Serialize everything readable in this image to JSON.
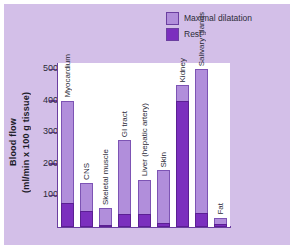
{
  "figure": {
    "background_color": "#d3bfe8",
    "plot_background_color": "#ffffff",
    "axis_color": "#6b3fa0"
  },
  "legend": {
    "position": "top-right",
    "items": [
      {
        "label": "Maximal dilatation",
        "color": "#b18edb"
      },
      {
        "label": "Rest",
        "color": "#7b2fbe"
      }
    ]
  },
  "axis_title": {
    "line1": "Blood flow",
    "line2": "(ml/min x 100 g tissue)"
  },
  "chart_data": {
    "type": "bar",
    "title": "",
    "subtitle": "",
    "xlabel": "",
    "ylabel": "Blood flow (ml/min x 100 g tissue)",
    "ylim": [
      0,
      520
    ],
    "yticks": [
      100,
      200,
      300,
      400,
      500
    ],
    "ytick_labels": [
      "100",
      "200",
      "300",
      "400",
      "500"
    ],
    "grid": false,
    "legend_position": "top-right",
    "overlap": "rest bars drawn in front of maximal dilatation bars, sharing the same baseline",
    "categories": [
      "Myocardium",
      "CNS",
      "Skeletal muscle",
      "GI tract",
      "Liver (hepatic artery)",
      "Skin",
      "Kidney",
      "Salivary glands",
      "Fat"
    ],
    "series": [
      {
        "name": "Maximal dilatation",
        "color": "#b18edb",
        "values": [
          400,
          140,
          60,
          275,
          150,
          180,
          450,
          500,
          30
        ]
      },
      {
        "name": "Rest",
        "color": "#7b2fbe",
        "values": [
          75,
          50,
          5,
          40,
          40,
          12,
          400,
          45,
          8
        ]
      }
    ]
  }
}
